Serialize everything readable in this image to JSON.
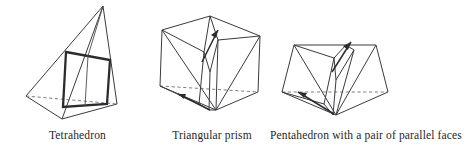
{
  "page": {
    "width": 466,
    "height": 148,
    "background": "#ffffff",
    "ink": "#2b2b30",
    "hidden_edge_color": "#6e6e78"
  },
  "figures": [
    {
      "id": "tetrahedron",
      "caption": "Tetrahedron",
      "highlight": "bold-quadrilateral-cross-section",
      "has_hidden_dashed_edge": true,
      "arrows": 0
    },
    {
      "id": "triangular-prism",
      "caption": "Triangular prism",
      "highlight": "inner-wedge",
      "has_hidden_dashed_edge": true,
      "arrows": 2
    },
    {
      "id": "pentahedron",
      "caption": "Pentahedron with a pair of parallel faces",
      "highlight": "inner-wedge",
      "has_hidden_dashed_edge": true,
      "arrows": 2
    }
  ],
  "captions": {
    "tetrahedron": "Tetrahedron",
    "prism": "Triangular prism",
    "pentahedron": "Pentahedron with a pair of parallel faces"
  }
}
